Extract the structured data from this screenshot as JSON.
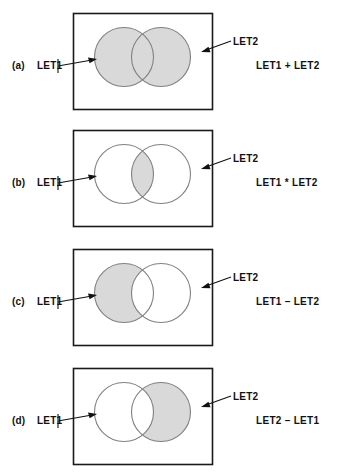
{
  "figure": {
    "set_names": {
      "a_set": "LET1",
      "b_set": "LET2"
    },
    "colors": {
      "shade_fill": "#d9d9d9",
      "circle_stroke": "#808080",
      "box_stroke": "#1a1a1a",
      "text": "#111111",
      "background": "#ffffff"
    },
    "panels": [
      {
        "letter": "(a)",
        "left_label": "LET1",
        "right_label": "LET2",
        "expression": "LET1 + LET2",
        "operation": "union",
        "shaded_regions": [
          "left-only",
          "intersection",
          "right-only"
        ]
      },
      {
        "letter": "(b)",
        "left_label": "LET1",
        "right_label": "LET2",
        "expression": "LET1 * LET2",
        "operation": "intersection",
        "shaded_regions": [
          "intersection"
        ]
      },
      {
        "letter": "(c)",
        "left_label": "LET1",
        "right_label": "LET2",
        "expression": "LET1 – LET2",
        "operation": "difference-a-minus-b",
        "shaded_regions": [
          "left-only"
        ]
      },
      {
        "letter": "(d)",
        "left_label": "LET1",
        "right_label": "LET2",
        "expression": "LET2 – LET1",
        "operation": "difference-b-minus-a",
        "shaded_regions": [
          "right-only"
        ]
      }
    ]
  }
}
